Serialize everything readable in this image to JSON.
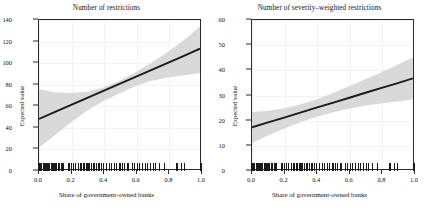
{
  "figure": {
    "axis_label_y": "Expected value",
    "axis_label_x": "Share of government-owned banks"
  },
  "chart_data": [
    {
      "type": "line",
      "panel": "left",
      "title": "Number of restrictions",
      "xlabel": "Share of government-owned banks",
      "ylabel": "Expected value",
      "xlim": [
        0.0,
        1.0
      ],
      "ylim": [
        0,
        140
      ],
      "xticks": [
        "0.0",
        "0.2",
        "0.4",
        "0.6",
        "0.8",
        "1.0"
      ],
      "xtick_values": [
        0.0,
        0.2,
        0.4,
        0.6,
        0.8,
        1.0
      ],
      "yticks": [
        "0",
        "20",
        "40",
        "60",
        "80",
        "100",
        "120",
        "140"
      ],
      "ytick_values": [
        0,
        20,
        40,
        60,
        80,
        100,
        120,
        140
      ],
      "grid": true,
      "legend": "none",
      "series": [
        {
          "name": "Expected value (fit)",
          "x": [
            0.0,
            0.1,
            0.2,
            0.3,
            0.4,
            0.5,
            0.6,
            0.7,
            0.8,
            0.9,
            1.0
          ],
          "values": [
            47.0,
            53.6,
            60.2,
            66.8,
            73.4,
            80.0,
            86.6,
            93.2,
            99.8,
            106.4,
            113.0
          ]
        },
        {
          "name": "Confidence band upper",
          "x": [
            0.0,
            0.1,
            0.2,
            0.3,
            0.4,
            0.5,
            0.6,
            0.7,
            0.8,
            0.9,
            1.0
          ],
          "values": [
            75.0,
            72.0,
            71.5,
            72.5,
            76.5,
            83.0,
            91.0,
            100.0,
            110.0,
            121.0,
            134.0
          ]
        },
        {
          "name": "Confidence band lower",
          "x": [
            0.0,
            0.1,
            0.2,
            0.3,
            0.4,
            0.5,
            0.6,
            0.7,
            0.8,
            0.9,
            1.0
          ],
          "values": [
            20.0,
            32.0,
            44.0,
            55.0,
            64.0,
            71.0,
            78.0,
            83.0,
            86.0,
            88.0,
            90.0
          ]
        }
      ],
      "rug_x": [
        0.0,
        0.005,
        0.01,
        0.015,
        0.02,
        0.03,
        0.035,
        0.04,
        0.05,
        0.055,
        0.06,
        0.07,
        0.08,
        0.085,
        0.09,
        0.1,
        0.105,
        0.11,
        0.12,
        0.125,
        0.13,
        0.14,
        0.15,
        0.155,
        0.185,
        0.19,
        0.2,
        0.215,
        0.225,
        0.23,
        0.245,
        0.255,
        0.265,
        0.275,
        0.285,
        0.295,
        0.3,
        0.305,
        0.315,
        0.325,
        0.335,
        0.345,
        0.355,
        0.37,
        0.375,
        0.385,
        0.4,
        0.415,
        0.435,
        0.45,
        0.465,
        0.48,
        0.495,
        0.5,
        0.515,
        0.53,
        0.545,
        0.555,
        0.575,
        0.59,
        0.605,
        0.62,
        0.635,
        0.655,
        0.67,
        0.685,
        0.705,
        0.72,
        0.745,
        0.77,
        0.845,
        0.855,
        0.88,
        0.895,
        0.995,
        1.0
      ]
    },
    {
      "type": "line",
      "panel": "right",
      "title": "Number of severity–weighted restrictions",
      "xlabel": "Share of government-owned banks",
      "ylabel": "Expected value",
      "xlim": [
        0.0,
        1.0
      ],
      "ylim": [
        0,
        60
      ],
      "xticks": [
        "0.0",
        "0.2",
        "0.4",
        "0.6",
        "0.8",
        "1.0"
      ],
      "xtick_values": [
        0.0,
        0.2,
        0.4,
        0.6,
        0.8,
        1.0
      ],
      "yticks": [
        "0",
        "10",
        "20",
        "30",
        "40",
        "50",
        "60"
      ],
      "ytick_values": [
        0,
        10,
        20,
        30,
        40,
        50,
        60
      ],
      "grid": true,
      "legend": "none",
      "series": [
        {
          "name": "Expected value (fit)",
          "x": [
            0.0,
            0.1,
            0.2,
            0.3,
            0.4,
            0.5,
            0.6,
            0.7,
            0.8,
            0.9,
            1.0
          ],
          "values": [
            16.8,
            18.8,
            20.7,
            22.7,
            24.7,
            26.6,
            28.6,
            30.6,
            32.6,
            34.5,
            36.5
          ]
        },
        {
          "name": "Confidence band upper",
          "x": [
            0.0,
            0.1,
            0.2,
            0.3,
            0.4,
            0.5,
            0.6,
            0.7,
            0.8,
            0.9,
            1.0
          ],
          "values": [
            23.0,
            23.5,
            24.5,
            26.0,
            28.0,
            30.5,
            33.2,
            36.0,
            38.9,
            41.8,
            45.0
          ]
        },
        {
          "name": "Confidence band lower",
          "x": [
            0.0,
            0.1,
            0.2,
            0.3,
            0.4,
            0.5,
            0.6,
            0.7,
            0.8,
            0.9,
            1.0
          ],
          "values": [
            10.5,
            13.5,
            16.3,
            18.8,
            21.0,
            22.8,
            24.3,
            25.5,
            26.4,
            27.2,
            28.0
          ]
        }
      ],
      "rug_x": [
        0.0,
        0.005,
        0.01,
        0.015,
        0.02,
        0.03,
        0.035,
        0.04,
        0.05,
        0.055,
        0.06,
        0.07,
        0.08,
        0.085,
        0.09,
        0.1,
        0.105,
        0.11,
        0.12,
        0.125,
        0.13,
        0.14,
        0.15,
        0.155,
        0.185,
        0.19,
        0.2,
        0.215,
        0.225,
        0.23,
        0.245,
        0.255,
        0.265,
        0.275,
        0.285,
        0.295,
        0.3,
        0.305,
        0.315,
        0.325,
        0.335,
        0.345,
        0.355,
        0.37,
        0.375,
        0.385,
        0.4,
        0.415,
        0.435,
        0.45,
        0.465,
        0.48,
        0.495,
        0.5,
        0.515,
        0.53,
        0.545,
        0.555,
        0.575,
        0.59,
        0.605,
        0.62,
        0.635,
        0.655,
        0.67,
        0.685,
        0.705,
        0.72,
        0.745,
        0.77,
        0.845,
        0.855,
        0.88,
        0.895,
        0.995,
        1.0
      ]
    }
  ],
  "colors": {
    "fit_line": "#1a1a1a",
    "band": "#d9d9d9",
    "axis": "#2b2b2b",
    "grid": "#f2f2f2",
    "rug": "#1a1a1a",
    "text": "#111111"
  }
}
